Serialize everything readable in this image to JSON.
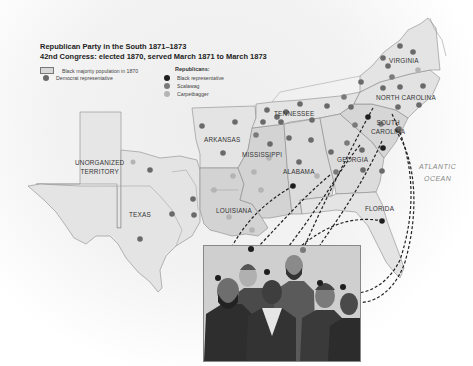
{
  "legend": {
    "title": "Republican Party in the South 1871–1873",
    "subtitle": "42nd Congress: elected 1870, served March 1871 to March 1873",
    "items": [
      {
        "label": "Black majority population in 1870",
        "symbol": "box",
        "color": "#d8d8d8"
      },
      {
        "label": "Democrat representative",
        "symbol": "dot",
        "color": "#6a6a6a"
      }
    ],
    "republicans_heading": "Republicans:",
    "republicans": [
      {
        "label": "Black representative",
        "color": "#1e1e1e"
      },
      {
        "label": "Scalawag",
        "color": "#7a7a7a"
      },
      {
        "label": "Carpetbagger",
        "color": "#b4b4b4"
      }
    ]
  },
  "states": [
    {
      "name": "VIRGINIA"
    },
    {
      "name": "NORTH CAROLINA"
    },
    {
      "name": "TENNESSEE"
    },
    {
      "name": "SOUTH CAROLINA",
      "line1": "SOUTH",
      "line2": "CAROLINA"
    },
    {
      "name": "ARKANSAS"
    },
    {
      "name": "MISSISSIPPI"
    },
    {
      "name": "ALABAMA"
    },
    {
      "name": "GEORGIA"
    },
    {
      "name": "UNORGANIZED TERRITORY",
      "line1": "UNORGANIZED",
      "line2": "TERRITORY"
    },
    {
      "name": "TEXAS"
    },
    {
      "name": "LOUISIANA"
    },
    {
      "name": "FLORIDA"
    }
  ],
  "ocean": {
    "line1": "ATLANTIC",
    "line2": "OCEAN"
  },
  "colors": {
    "state_fill": "#e4e4e4",
    "black_majority_fill": "#d2d2d2",
    "border": "#8a8a8a",
    "black_rep": "#1e1e1e",
    "scalawag": "#7a7a7a",
    "carpetbagger": "#b4b4b4",
    "democrat": "#6a6a6a"
  },
  "portrait": {
    "caption": "",
    "figures": 7
  }
}
